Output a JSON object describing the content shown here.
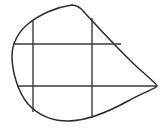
{
  "figure": {
    "canvas": {
      "width": 165,
      "height": 130,
      "background": "#ffffff"
    },
    "stroke": {
      "outline_color": "#2b2b2b",
      "grid_color": "#3a3a3a",
      "outline_width": 1.5,
      "grid_width": 1.4
    },
    "outline": {
      "name": "blob-outline",
      "path": "M 72 5 C 57 7 40 14 28 24 C 18 32 12 44 12 56 C 12 72 18 92 28 104 C 38 115 52 121 68 121 C 86 121 108 112 128 101 C 144 92 157 88 157 86 C 157 84 148 77 136 66 C 118 49 95 24 84 12 C 80 7 76 5 72 5 Z",
      "apex": {
        "x": 72,
        "y": 5
      },
      "leftmost": {
        "x": 12,
        "y": 56
      },
      "rightmost": {
        "x": 157,
        "y": 86
      },
      "bottom": {
        "x": 68,
        "y": 121
      }
    },
    "grid_lines": [
      {
        "name": "vertical-line-left",
        "orientation": "vertical",
        "x1": 33,
        "y1": 21,
        "x2": 33,
        "y2": 112
      },
      {
        "name": "vertical-line-right",
        "orientation": "vertical",
        "x1": 92,
        "y1": 18,
        "x2": 92,
        "y2": 118
      },
      {
        "name": "horizontal-line-upper",
        "orientation": "horizontal",
        "x1": 13,
        "y1": 44,
        "x2": 121,
        "y2": 44
      },
      {
        "name": "horizontal-line-lower",
        "orientation": "horizontal",
        "x1": 17,
        "y1": 86,
        "x2": 157,
        "y2": 86
      }
    ]
  }
}
